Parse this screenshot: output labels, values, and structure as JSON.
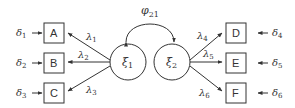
{
  "diagram": {
    "type": "confirmatory factor analysis path diagram",
    "covariance_label": {
      "symbol": "φ",
      "sub": "21"
    },
    "latent_factors": [
      {
        "id": "xi1",
        "symbol": "ξ",
        "sub": "1"
      },
      {
        "id": "xi2",
        "symbol": "ξ",
        "sub": "2"
      }
    ],
    "indicators": [
      {
        "label": "A",
        "error": {
          "symbol": "δ",
          "sub": "1"
        },
        "loading": {
          "symbol": "λ",
          "sub": "1"
        },
        "factor": "xi1"
      },
      {
        "label": "B",
        "error": {
          "symbol": "δ",
          "sub": "2"
        },
        "loading": {
          "symbol": "λ",
          "sub": "2"
        },
        "factor": "xi1"
      },
      {
        "label": "C",
        "error": {
          "symbol": "δ",
          "sub": "3"
        },
        "loading": {
          "symbol": "λ",
          "sub": "3"
        },
        "factor": "xi1"
      },
      {
        "label": "D",
        "error": {
          "symbol": "δ",
          "sub": "4"
        },
        "loading": {
          "symbol": "λ",
          "sub": "4"
        },
        "factor": "xi2"
      },
      {
        "label": "E",
        "error": {
          "symbol": "δ",
          "sub": "5"
        },
        "loading": {
          "symbol": "λ",
          "sub": "5"
        },
        "factor": "xi2"
      },
      {
        "label": "F",
        "error": {
          "symbol": "δ",
          "sub": "6"
        },
        "loading": {
          "symbol": "λ",
          "sub": "6"
        },
        "factor": "xi2"
      }
    ],
    "colors": {
      "stroke": "#333333",
      "background": "#ffffff"
    }
  }
}
